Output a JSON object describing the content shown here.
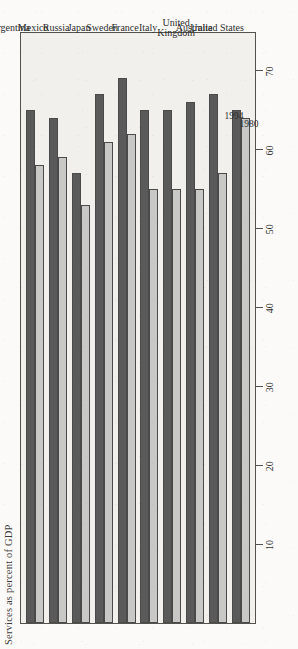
{
  "figure": {
    "title": "Services as percent of GDP",
    "background_color": "#f2f0ec",
    "frame_color": "#55524e"
  },
  "legend": {
    "entries": [
      {
        "label": "1994",
        "color": "#5a5a5a"
      },
      {
        "label": "1980",
        "color": "#c8c8c6"
      }
    ]
  },
  "axis": {
    "tick_labels": [
      "70",
      "60",
      "50",
      "40",
      "30",
      "20",
      "10"
    ],
    "min": 0,
    "max": 75
  },
  "chart_data": {
    "type": "bar",
    "title": "Services as percent of GDP",
    "xlabel": "",
    "ylabel": "",
    "orientation": "horizontal",
    "grid": false,
    "legend_position": "inline-annotation",
    "xlim": [
      0,
      75
    ],
    "categories": [
      "United States",
      "Australia",
      "United\nKingdom",
      "Italy",
      "France",
      "Sweden",
      "Japan",
      "Russia",
      "Mexico",
      "Argentina"
    ],
    "series": [
      {
        "name": "1994",
        "color": "#5a5a5a",
        "values": [
          65,
          67,
          66,
          65,
          65,
          69,
          67,
          57,
          64,
          65
        ]
      },
      {
        "name": "1980",
        "color": "#c8c8c6",
        "values": [
          64,
          57,
          55,
          55,
          55,
          62,
          61,
          53,
          59,
          58
        ]
      }
    ]
  }
}
